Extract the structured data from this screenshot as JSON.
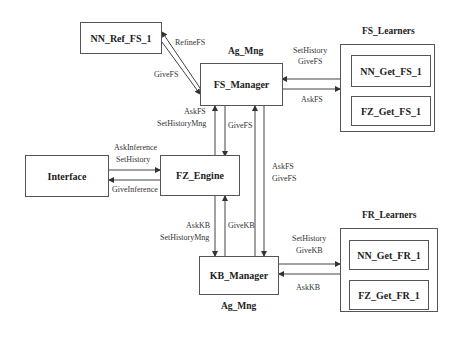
{
  "nodes": {
    "nn_ref_fs": "NN_Ref_FS_1",
    "fs_manager": "FS_Manager",
    "fz_engine": "FZ_Engine",
    "interface": "Interface",
    "kb_manager": "KB_Manager",
    "nn_get_fs": "NN_Get_FS_1",
    "fz_get_fs": "FZ_Get_FS_1",
    "nn_get_fr": "NN_Get_FR_1",
    "fz_get_fr": "FZ_Get_FR_1"
  },
  "groups": {
    "fs_learners": "FS_Learners",
    "fr_learners": "FR_Learners",
    "ag_mng_top": "Ag_Mng",
    "ag_mng_bottom": "Ag_Mng"
  },
  "edges": {
    "refine_fs": "RefineFS",
    "give_fs_ref": "GiveFS",
    "set_history_fs_l1": "SetHistory",
    "set_history_fs_l2": "GiveFS",
    "ask_fs_learners": "AskFS",
    "ask_fs_engine_l1": "AskFS",
    "ask_fs_engine_l2": "SetHistoryMng",
    "give_fs_engine": "GiveFS",
    "ask_inference_l1": "AskInference",
    "ask_inference_l2": "SetHistory",
    "give_inference": "GiveInference",
    "ask_kb_engine_l1": "AskKB",
    "ask_kb_engine_l2": "SetHistoryMng",
    "give_kb_engine": "GiveKB",
    "fs_kb_l1": "AskFS",
    "fs_kb_l2": "GiveFS",
    "set_history_kb_l1": "SetHistory",
    "set_history_kb_l2": "GiveKB",
    "ask_kb_learners": "AskKB"
  }
}
